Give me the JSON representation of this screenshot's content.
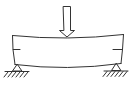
{
  "diagram": {
    "type": "simply-supported-beam-center-load",
    "stroke_color": "#333333",
    "background": "#ffffff",
    "load": {
      "icon": "down-arrow-icon",
      "position": "center"
    },
    "beam": {
      "shape": "deflected-sagging",
      "side_marks": 2
    },
    "supports": [
      {
        "side": "left",
        "icon": "pin-support-icon"
      },
      {
        "side": "right",
        "icon": "pin-support-icon"
      }
    ]
  }
}
